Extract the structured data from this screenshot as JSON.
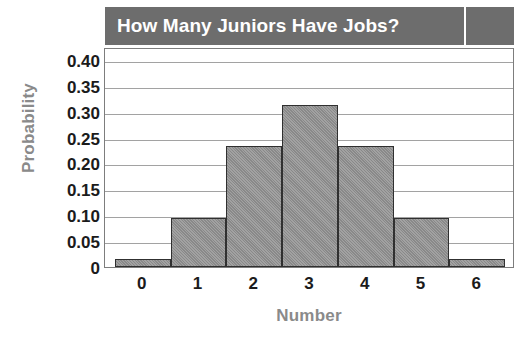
{
  "chart_data": {
    "type": "bar",
    "title": "How Many Juniors Have Jobs?",
    "xlabel": "Number",
    "ylabel": "Probability",
    "categories": [
      "0",
      "1",
      "2",
      "3",
      "4",
      "5",
      "6"
    ],
    "values": [
      0.0156,
      0.0938,
      0.2344,
      0.3125,
      0.2344,
      0.0938,
      0.0156
    ],
    "ylim": [
      0,
      0.425
    ],
    "ytick_values": [
      0,
      0.05,
      0.1,
      0.15,
      0.2,
      0.25,
      0.3,
      0.35,
      0.4
    ],
    "ytick_labels": [
      "0",
      "0.05",
      "0.10",
      "0.15",
      "0.20",
      "0.25",
      "0.30",
      "0.35",
      "0.40"
    ],
    "xtick_labels": [
      "0",
      "1",
      "2",
      "3",
      "4",
      "5",
      "6"
    ],
    "grid": true,
    "grid_axis": "y",
    "legend": false,
    "legend_position": "none",
    "bar_fill_color": "#909090",
    "bar_edge_color": "#303030",
    "title_band_color": "#6d6d6d",
    "title_text_color": "#ffffff",
    "axis_label_color": "#8a8a8a",
    "tick_label_color": "#1b1b1b",
    "gridline_color": "#a2a2a2",
    "plot_border_color": "#7d7d7d",
    "background_color": "#ffffff"
  }
}
